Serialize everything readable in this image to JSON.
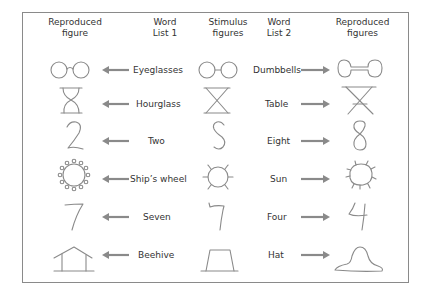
{
  "headers": {
    "reproduced_1": "Reproduced\nfigure",
    "word_list_1": "Word\nList 1",
    "stimulus": "Stimulus\nfigures",
    "word_list_2": "Word\nList 2",
    "reproduced_2": "Reproduced\nfigures"
  },
  "rows": [
    {
      "list1": "Eyeglasses",
      "list2": "Dumbbells",
      "stimulus": "two-circles-joined"
    },
    {
      "list1": "Hourglass",
      "list2": "Table",
      "stimulus": "crossed-lines-hourglass"
    },
    {
      "list1": "Two",
      "list2": "Eight",
      "stimulus": "s-curve"
    },
    {
      "list1": "Ship’s wheel",
      "list2": "Sun",
      "stimulus": "circle-with-rays"
    },
    {
      "list1": "Seven",
      "list2": "Four",
      "stimulus": "hooked-seven"
    },
    {
      "list1": "Beehive",
      "list2": "Hat",
      "stimulus": "trapezoid"
    }
  ],
  "colors": {
    "stroke": "#8a8a8a",
    "border": "#8a8a8a",
    "text": "#333333"
  }
}
